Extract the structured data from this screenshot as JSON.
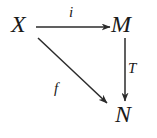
{
  "diagram": {
    "type": "commutative-diagram",
    "background_color": "#ffffff",
    "stroke_color": "#2b2b2b",
    "nodes": [
      {
        "id": "X",
        "label": "X",
        "x": 22,
        "y": 24
      },
      {
        "id": "M",
        "label": "M",
        "x": 126,
        "y": 24
      },
      {
        "id": "N",
        "label": "N",
        "x": 129,
        "y": 114
      }
    ],
    "edges": [
      {
        "id": "i",
        "label": "i",
        "from": "X",
        "to": "M",
        "direction": "horizontal-right",
        "label_position": "above",
        "x1": 36,
        "y1": 27,
        "x2": 110,
        "y2": 27
      },
      {
        "id": "T",
        "label": "T",
        "from": "M",
        "to": "N",
        "direction": "vertical-down",
        "label_position": "right",
        "x1": 125,
        "y1": 38,
        "x2": 125,
        "y2": 101
      },
      {
        "id": "f",
        "label": "f",
        "from": "X",
        "to": "N",
        "direction": "diagonal-down-right",
        "label_position": "below-left",
        "x1": 38,
        "y1": 38,
        "x2": 107,
        "y2": 103
      }
    ]
  }
}
